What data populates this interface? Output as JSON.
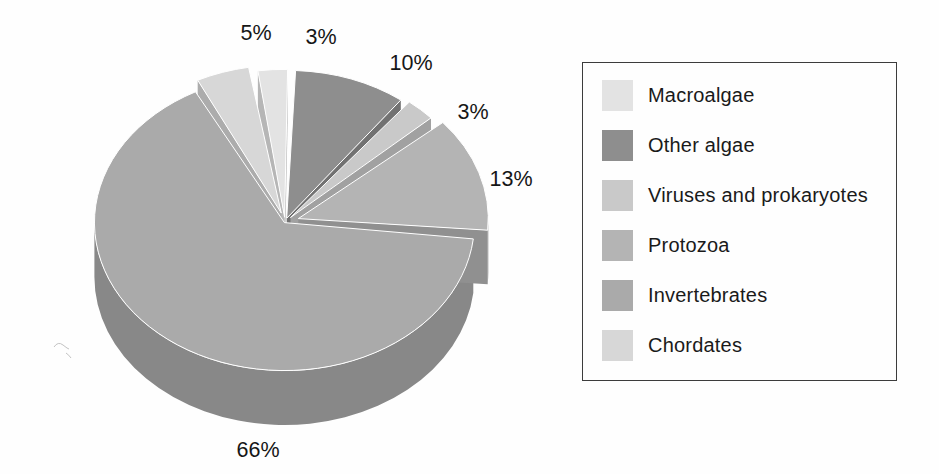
{
  "page": {
    "background": "#fefefe"
  },
  "chart_data": {
    "type": "pie",
    "style": "3d exploded pie, grayscale scanned figure",
    "title": "",
    "unit": "percent",
    "legend_position": "right",
    "grid": false,
    "slices": [
      {
        "label": "Macroalgae",
        "value": 3,
        "pct_label": "3%",
        "color": "#e3e3e3"
      },
      {
        "label": "Other algae",
        "value": 10,
        "pct_label": "10%",
        "color": "#8e8e8e"
      },
      {
        "label": "Viruses and prokaryotes",
        "value": 3,
        "pct_label": "3%",
        "color": "#c9c9c9"
      },
      {
        "label": "Protozoa",
        "value": 13,
        "pct_label": "13%",
        "color": "#b4b4b4"
      },
      {
        "label": "Invertebrates",
        "value": 66,
        "pct_label": "66%",
        "color": "#aaaaaa"
      },
      {
        "label": "Chordates",
        "value": 5,
        "pct_label": "5%",
        "color": "#d7d7d7"
      }
    ]
  }
}
